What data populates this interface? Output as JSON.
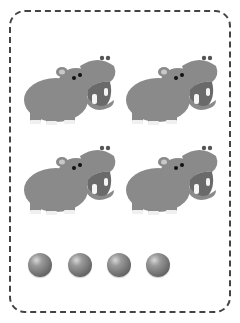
{
  "worksheet": {
    "type": "counting",
    "animal": "hippo",
    "animal_count": 4,
    "ball_count": 4,
    "colors": {
      "hippo_body": "#8a8a8a",
      "hippo_mouth": "#6a6a6a",
      "ball": "#7a7a7a",
      "border": "#444444"
    }
  }
}
